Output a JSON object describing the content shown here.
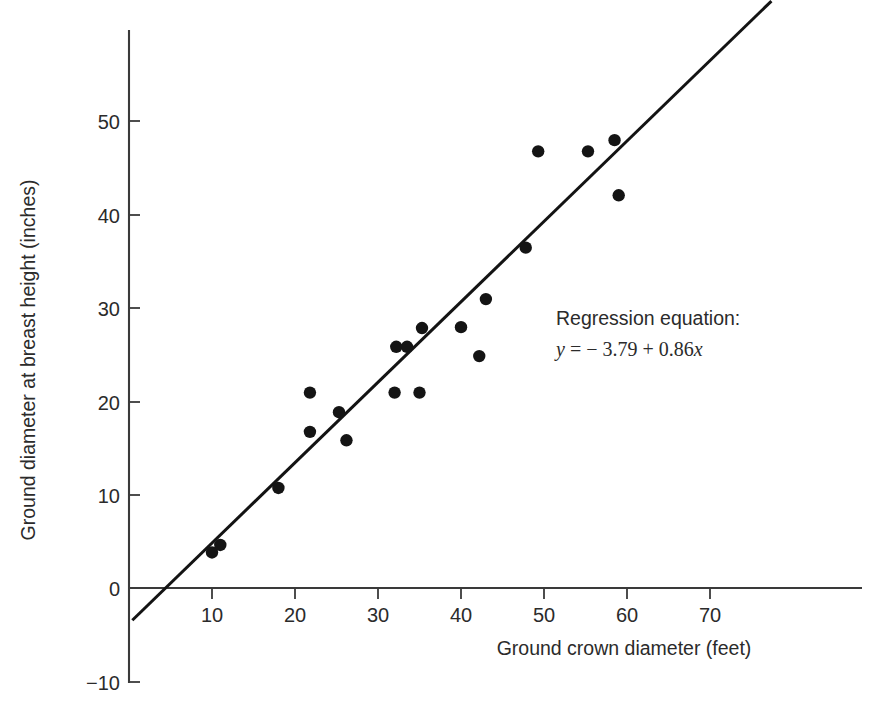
{
  "figure": {
    "background": "#ffffff",
    "ink_color": "#1a1a1a"
  },
  "chart_data": {
    "type": "scatter",
    "title": "",
    "subtitle": "",
    "xlabel": "Ground crown diameter (feet)",
    "ylabel": "Ground diameter at breast height (inches)",
    "xlim": [
      0,
      79
    ],
    "ylim": [
      -10,
      58
    ],
    "xticks": [
      10,
      20,
      30,
      40,
      50,
      60,
      70
    ],
    "xtick_labels": [
      "10",
      "20",
      "30",
      "40",
      "50",
      "60",
      "70"
    ],
    "yticks": [
      -10,
      0,
      10,
      20,
      30,
      40,
      50
    ],
    "ytick_labels": [
      "−10",
      "0",
      "10",
      "20",
      "30",
      "40",
      "50"
    ],
    "grid": false,
    "legend": false,
    "legend_position": "none",
    "marker": {
      "shape": "circle",
      "size": 8,
      "color": "#141414"
    },
    "points": [
      {
        "x": 10.0,
        "y": 3.8
      },
      {
        "x": 11.0,
        "y": 4.6
      },
      {
        "x": 18.0,
        "y": 10.7
      },
      {
        "x": 21.8,
        "y": 20.9
      },
      {
        "x": 21.8,
        "y": 16.7
      },
      {
        "x": 25.3,
        "y": 18.8
      },
      {
        "x": 26.2,
        "y": 15.8
      },
      {
        "x": 32.0,
        "y": 20.9
      },
      {
        "x": 32.2,
        "y": 25.8
      },
      {
        "x": 33.5,
        "y": 25.8
      },
      {
        "x": 35.0,
        "y": 20.9
      },
      {
        "x": 35.3,
        "y": 27.8
      },
      {
        "x": 40.0,
        "y": 27.9
      },
      {
        "x": 42.2,
        "y": 24.8
      },
      {
        "x": 43.0,
        "y": 30.9
      },
      {
        "x": 47.8,
        "y": 36.4
      },
      {
        "x": 49.3,
        "y": 46.7
      },
      {
        "x": 55.3,
        "y": 46.7
      },
      {
        "x": 58.5,
        "y": 47.9
      },
      {
        "x": 59.0,
        "y": 42.0
      }
    ],
    "series": [
      {
        "name": "regression line",
        "type": "line",
        "color": "#131313",
        "slope": 0.86,
        "intercept": -3.79,
        "x_start": 0.4,
        "x_end": 77.4
      }
    ],
    "annotations": [
      {
        "name": "regression-equation",
        "line1": "Regression equation:",
        "line2_y": "y",
        "line2_eq": " =  − 3.79 + 0.86",
        "line2_x": "x",
        "x": 48.5,
        "y": 31.5
      }
    ]
  }
}
